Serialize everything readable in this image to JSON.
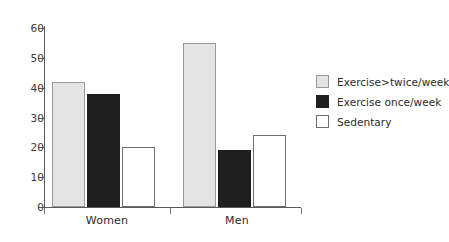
{
  "chart_data": {
    "type": "bar",
    "title": "",
    "xlabel": "",
    "ylabel": "",
    "categories": [
      "Women",
      "Men"
    ],
    "series": [
      {
        "name": "Exercise>twice/week",
        "values": [
          42,
          55
        ],
        "color": "#e4e4e4"
      },
      {
        "name": "Exercise once/week",
        "values": [
          38,
          19
        ],
        "color": "#1f1f1f"
      },
      {
        "name": "Sedentary",
        "values": [
          20,
          24
        ],
        "color": "#ffffff"
      }
    ],
    "ylim": [
      0,
      60
    ],
    "ytick_labels": [
      "0",
      "10",
      "20",
      "30",
      "40",
      "50",
      "60"
    ],
    "ytick_values": [
      0,
      10,
      20,
      30,
      40,
      50,
      60
    ],
    "grid": false,
    "legend_position": "right"
  },
  "legend": {
    "items": [
      {
        "label": "Exercise>twice/week",
        "swatch": "light"
      },
      {
        "label": "Exercise once/week",
        "swatch": "dark"
      },
      {
        "label": "Sedentary",
        "swatch": "white"
      }
    ]
  },
  "axis": {
    "y_ticks": [
      {
        "label": "60",
        "value": 60
      },
      {
        "label": "50",
        "value": 50
      },
      {
        "label": "40",
        "value": 40
      },
      {
        "label": "30",
        "value": 30
      },
      {
        "label": "20",
        "value": 20
      },
      {
        "label": "10",
        "value": 10
      },
      {
        "label": "0",
        "value": 0
      }
    ],
    "x_categories": [
      "Women",
      "Men"
    ]
  },
  "colors": {
    "light_gray": "#e4e4e4",
    "dark": "#1f1f1f",
    "white": "#ffffff",
    "axis": "#5a5a5a",
    "text": "#2b2b2b"
  }
}
